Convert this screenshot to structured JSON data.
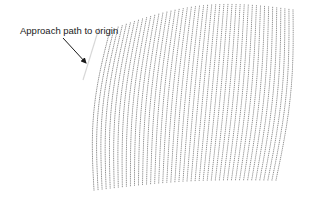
{
  "figure": {
    "annotation": {
      "label": "Approach path to origin",
      "arrow": {
        "from": [
          63,
          38
        ],
        "to": [
          86,
          63
        ]
      }
    },
    "approach_path": {
      "from": [
        99,
        28
      ],
      "to": [
        83,
        80
      ],
      "color": "#d8d8d8"
    },
    "mesh": {
      "description": "Deformed dotted grid surface",
      "dot_color": "#8a8a8a",
      "rows": 46,
      "cols": 46,
      "corners": {
        "top_left": [
          110,
          30
        ],
        "top_right": [
          293,
          10
        ],
        "bottom_right": [
          276,
          180
        ],
        "bottom_left": [
          94,
          190
        ]
      },
      "edge_bulge": {
        "top": [
          0,
          -14
        ],
        "right": [
          6,
          0
        ],
        "bottom": [
          0,
          -4
        ],
        "left": [
          -8,
          0
        ]
      }
    }
  }
}
